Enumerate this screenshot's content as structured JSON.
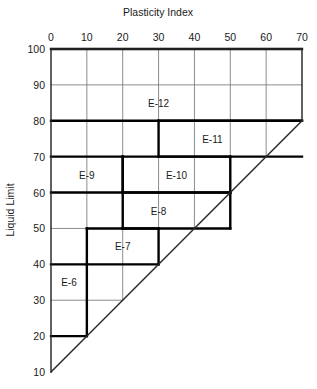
{
  "chart_data": {
    "type": "line",
    "title": "",
    "xlabel": "Plasticity Index",
    "ylabel": "Liquid Limit",
    "xlim": [
      0,
      70
    ],
    "ylim": [
      10,
      100
    ],
    "grid": true,
    "legend_position": "none",
    "xticks": [
      0,
      10,
      20,
      30,
      40,
      50,
      60,
      70
    ],
    "xtick_labels": [
      "0",
      "10",
      "20",
      "30",
      "40",
      "50",
      "60",
      "70"
    ],
    "yticks": [
      10,
      20,
      30,
      40,
      50,
      60,
      70,
      80,
      90,
      100
    ],
    "ytick_labels": [
      "10",
      "20",
      "30",
      "40",
      "50",
      "60",
      "70",
      "80",
      "90",
      "100"
    ],
    "annotations": [
      {
        "text": "E-12",
        "x": 30,
        "y": 85
      },
      {
        "text": "E-11",
        "x": 45,
        "y": 75
      },
      {
        "text": "E-10",
        "x": 35,
        "y": 65
      },
      {
        "text": "E-9",
        "x": 10,
        "y": 65
      },
      {
        "text": "E-8",
        "x": 30,
        "y": 55
      },
      {
        "text": "E-7",
        "x": 20,
        "y": 45
      },
      {
        "text": "E-6",
        "x": 5,
        "y": 35
      }
    ],
    "zones": [
      {
        "name": "E-6",
        "x0": 0,
        "x1": 10,
        "y0": 20,
        "y1": 40
      },
      {
        "name": "E-7",
        "x0": 10,
        "x1": 30,
        "y0": 40,
        "y1": 50
      },
      {
        "name": "E-8",
        "x0": 20,
        "x1": 50,
        "y0": 50,
        "y1": 60
      },
      {
        "name": "E-9",
        "x0": 0,
        "x1": 20,
        "y0": 60,
        "y1": 70
      },
      {
        "name": "E-10",
        "x0": 20,
        "x1": 50,
        "y0": 60,
        "y1": 70
      },
      {
        "name": "E-11",
        "x0": 30,
        "x1": 70,
        "y0": 70,
        "y1": 80
      },
      {
        "name": "E-12",
        "x0": 0,
        "x1": 70,
        "y0": 80,
        "y1": 100
      }
    ],
    "series": [
      {
        "name": "A-line boundary",
        "x": [
          0,
          70
        ],
        "values": [
          10,
          80
        ],
        "note": "Liquid Limit = Plasticity Index + 10"
      }
    ],
    "colors": {
      "grid": "#6e6e6e",
      "frame": "#2b2b2b",
      "bold": "#000000",
      "text": "#1a1a1a",
      "background": "#ffffff"
    }
  }
}
